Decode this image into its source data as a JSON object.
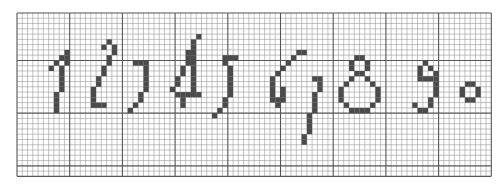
{
  "grid": {
    "origin_x": 17,
    "origin_y": 13,
    "cell": 5.27,
    "cols": 90,
    "rows": 31,
    "major_every": 10,
    "minor_color": "#9a9a9a",
    "major_color": "#555555",
    "fill_color": "#4a4a4a"
  },
  "digits": [
    {
      "label": "1",
      "cells": [
        [
          9,
          7
        ],
        [
          8,
          8
        ],
        [
          9,
          8
        ],
        [
          7,
          9
        ],
        [
          9,
          9
        ],
        [
          6,
          10
        ],
        [
          8,
          10
        ],
        [
          8,
          11
        ],
        [
          8,
          12
        ],
        [
          8,
          13
        ],
        [
          8,
          14
        ],
        [
          7,
          15
        ],
        [
          7,
          16
        ],
        [
          7,
          17
        ],
        [
          7,
          18
        ]
      ]
    },
    {
      "label": "2",
      "cells": [
        [
          17,
          5
        ],
        [
          16,
          6
        ],
        [
          18,
          6
        ],
        [
          18,
          7
        ],
        [
          17,
          8
        ],
        [
          17,
          9
        ],
        [
          16,
          10
        ],
        [
          16,
          11
        ],
        [
          15,
          12
        ],
        [
          15,
          13
        ],
        [
          14,
          14
        ],
        [
          14,
          15
        ],
        [
          14,
          16
        ],
        [
          14,
          17
        ],
        [
          15,
          17
        ],
        [
          16,
          17
        ]
      ]
    },
    {
      "label": "3",
      "cells": [
        [
          22,
          9
        ],
        [
          23,
          9
        ],
        [
          24,
          9
        ],
        [
          24,
          10
        ],
        [
          24,
          11
        ],
        [
          24,
          12
        ],
        [
          24,
          13
        ],
        [
          24,
          14
        ],
        [
          23,
          15
        ],
        [
          23,
          16
        ],
        [
          22,
          17
        ],
        [
          21,
          18
        ]
      ]
    },
    {
      "label": "4",
      "cells": [
        [
          34,
          4
        ],
        [
          33,
          5
        ],
        [
          33,
          6
        ],
        [
          32,
          7
        ],
        [
          33,
          7
        ],
        [
          32,
          8
        ],
        [
          33,
          8
        ],
        [
          32,
          9
        ],
        [
          33,
          9
        ],
        [
          31,
          10
        ],
        [
          33,
          10
        ],
        [
          31,
          11
        ],
        [
          33,
          11
        ],
        [
          30,
          12
        ],
        [
          33,
          12
        ],
        [
          30,
          13
        ],
        [
          33,
          13
        ],
        [
          29,
          14
        ],
        [
          33,
          14
        ],
        [
          30,
          15
        ],
        [
          31,
          15
        ],
        [
          32,
          15
        ],
        [
          33,
          15
        ],
        [
          34,
          15
        ],
        [
          31,
          16
        ],
        [
          31,
          17
        ]
      ]
    },
    {
      "label": "5",
      "cells": [
        [
          39,
          8
        ],
        [
          40,
          8
        ],
        [
          41,
          8
        ],
        [
          39,
          9
        ],
        [
          40,
          10
        ],
        [
          40,
          11
        ],
        [
          40,
          12
        ],
        [
          40,
          13
        ],
        [
          40,
          14
        ],
        [
          40,
          15
        ],
        [
          39,
          16
        ],
        [
          39,
          17
        ],
        [
          38,
          18
        ],
        [
          37,
          19
        ]
      ]
    },
    {
      "label": "6",
      "cells": [
        [
          53,
          7
        ],
        [
          54,
          7
        ],
        [
          52,
          8
        ],
        [
          51,
          9
        ],
        [
          50,
          10
        ],
        [
          49,
          11
        ],
        [
          48,
          12
        ],
        [
          48,
          13
        ],
        [
          48,
          14
        ],
        [
          48,
          15
        ],
        [
          48,
          16
        ],
        [
          49,
          16
        ],
        [
          50,
          16
        ],
        [
          50,
          15
        ],
        [
          50,
          14
        ],
        [
          49,
          17
        ]
      ]
    },
    {
      "label": "7",
      "cells": [
        [
          56,
          12
        ],
        [
          57,
          12
        ],
        [
          57,
          13
        ],
        [
          57,
          14
        ],
        [
          56,
          15
        ],
        [
          56,
          16
        ],
        [
          56,
          17
        ],
        [
          56,
          18
        ],
        [
          55,
          19
        ],
        [
          55,
          20
        ],
        [
          55,
          21
        ],
        [
          55,
          22
        ],
        [
          54,
          23
        ],
        [
          54,
          24
        ]
      ]
    },
    {
      "label": "8",
      "cells": [
        [
          64,
          8
        ],
        [
          65,
          8
        ],
        [
          63,
          9
        ],
        [
          66,
          9
        ],
        [
          63,
          10
        ],
        [
          66,
          10
        ],
        [
          64,
          11
        ],
        [
          65,
          11
        ],
        [
          63,
          12
        ],
        [
          66,
          12
        ],
        [
          62,
          13
        ],
        [
          67,
          13
        ],
        [
          61,
          14
        ],
        [
          68,
          14
        ],
        [
          61,
          15
        ],
        [
          68,
          15
        ],
        [
          61,
          16
        ],
        [
          68,
          16
        ],
        [
          62,
          17
        ],
        [
          67,
          17
        ],
        [
          63,
          18
        ],
        [
          64,
          18
        ],
        [
          65,
          18
        ],
        [
          66,
          18
        ]
      ]
    },
    {
      "label": "9",
      "cells": [
        [
          77,
          9
        ],
        [
          76,
          10
        ],
        [
          78,
          10
        ],
        [
          76,
          11
        ],
        [
          79,
          11
        ],
        [
          76,
          12
        ],
        [
          77,
          12
        ],
        [
          78,
          12
        ],
        [
          79,
          12
        ],
        [
          79,
          13
        ],
        [
          79,
          14
        ],
        [
          79,
          15
        ],
        [
          78,
          16
        ],
        [
          78,
          17
        ],
        [
          75,
          17
        ],
        [
          76,
          18
        ],
        [
          77,
          18
        ]
      ]
    },
    {
      "label": "0",
      "cells": [
        [
          85,
          13
        ],
        [
          86,
          13
        ],
        [
          84,
          14
        ],
        [
          87,
          14
        ],
        [
          84,
          15
        ],
        [
          87,
          15
        ],
        [
          85,
          16
        ],
        [
          86,
          16
        ]
      ]
    }
  ]
}
